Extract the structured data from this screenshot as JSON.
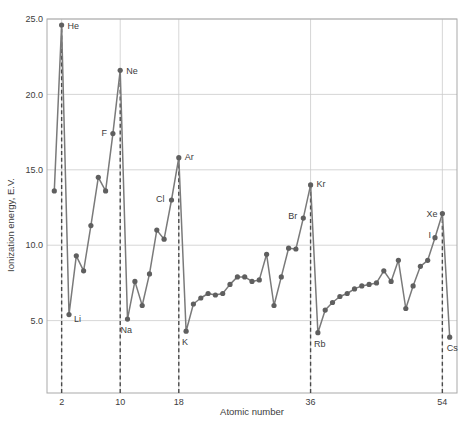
{
  "figure": {
    "background": "#ffffff"
  },
  "colors": {
    "line": "#7a7a7a",
    "marker": "#5f5f5f",
    "dashed_guide": "#4a4a4a",
    "grid": "#cccccc",
    "frame": "#a9a9a9",
    "text": "#3c3c3c"
  },
  "chart_data": {
    "type": "line",
    "title": "",
    "xlabel": "Atomic number",
    "ylabel": "Ionization energy, E.V.",
    "xlim": [
      0,
      56
    ],
    "ylim": [
      0.2,
      25.0
    ],
    "grid": true,
    "x_ticks": [
      {
        "value": 2,
        "label": "2"
      },
      {
        "value": 10,
        "label": "10"
      },
      {
        "value": 18,
        "label": "18"
      },
      {
        "value": 36,
        "label": "36"
      },
      {
        "value": 54,
        "label": "54"
      }
    ],
    "y_ticks": [
      {
        "value": 5,
        "label": "5.0"
      },
      {
        "value": 10,
        "label": "10.0"
      },
      {
        "value": 15,
        "label": "15.0"
      },
      {
        "value": 20,
        "label": "20.0"
      },
      {
        "value": 25,
        "label": "25.0"
      }
    ],
    "series": [
      {
        "name": "First ionization energy",
        "points": [
          {
            "Z": 1,
            "symbol": "H",
            "ev": 13.6
          },
          {
            "Z": 2,
            "symbol": "He",
            "ev": 24.6,
            "label": "He",
            "label_anchor": "start",
            "label_dx": 6,
            "label_dy": 4
          },
          {
            "Z": 3,
            "symbol": "Li",
            "ev": 5.4,
            "label": "Li",
            "label_anchor": "start",
            "label_dx": 5,
            "label_dy": 7
          },
          {
            "Z": 4,
            "symbol": "Be",
            "ev": 9.3
          },
          {
            "Z": 5,
            "symbol": "B",
            "ev": 8.3
          },
          {
            "Z": 6,
            "symbol": "C",
            "ev": 11.3
          },
          {
            "Z": 7,
            "symbol": "N",
            "ev": 14.5
          },
          {
            "Z": 8,
            "symbol": "O",
            "ev": 13.6
          },
          {
            "Z": 9,
            "symbol": "F",
            "ev": 17.4,
            "label": "F",
            "label_anchor": "end",
            "label_dx": -6,
            "label_dy": 2
          },
          {
            "Z": 10,
            "symbol": "Ne",
            "ev": 21.6,
            "label": "Ne",
            "label_anchor": "start",
            "label_dx": 6,
            "label_dy": 4
          },
          {
            "Z": 11,
            "symbol": "Na",
            "ev": 5.1,
            "label": "Na",
            "label_anchor": "start",
            "label_dx": -7,
            "label_dy": 14
          },
          {
            "Z": 12,
            "symbol": "Mg",
            "ev": 7.6
          },
          {
            "Z": 13,
            "symbol": "Al",
            "ev": 6.0
          },
          {
            "Z": 14,
            "symbol": "Si",
            "ev": 8.1
          },
          {
            "Z": 15,
            "symbol": "P",
            "ev": 11.0
          },
          {
            "Z": 16,
            "symbol": "S",
            "ev": 10.4
          },
          {
            "Z": 17,
            "symbol": "Cl",
            "ev": 13.0,
            "label": "Cl",
            "label_anchor": "end",
            "label_dx": -7,
            "label_dy": 2
          },
          {
            "Z": 18,
            "symbol": "Ar",
            "ev": 15.8,
            "label": "Ar",
            "label_anchor": "start",
            "label_dx": 6,
            "label_dy": 2
          },
          {
            "Z": 19,
            "symbol": "K",
            "ev": 4.3,
            "label": "K",
            "label_anchor": "start",
            "label_dx": -4,
            "label_dy": 14
          },
          {
            "Z": 20,
            "symbol": "Ca",
            "ev": 6.1
          },
          {
            "Z": 21,
            "symbol": "Sc",
            "ev": 6.5
          },
          {
            "Z": 22,
            "symbol": "Ti",
            "ev": 6.8
          },
          {
            "Z": 23,
            "symbol": "V",
            "ev": 6.7
          },
          {
            "Z": 24,
            "symbol": "Cr",
            "ev": 6.8
          },
          {
            "Z": 25,
            "symbol": "Mn",
            "ev": 7.4
          },
          {
            "Z": 26,
            "symbol": "Fe",
            "ev": 7.9
          },
          {
            "Z": 27,
            "symbol": "Co",
            "ev": 7.9
          },
          {
            "Z": 28,
            "symbol": "Ni",
            "ev": 7.6
          },
          {
            "Z": 29,
            "symbol": "Cu",
            "ev": 7.7
          },
          {
            "Z": 30,
            "symbol": "Zn",
            "ev": 9.4
          },
          {
            "Z": 31,
            "symbol": "Ga",
            "ev": 6.0
          },
          {
            "Z": 32,
            "symbol": "Ge",
            "ev": 7.9
          },
          {
            "Z": 33,
            "symbol": "As",
            "ev": 9.8
          },
          {
            "Z": 34,
            "symbol": "Se",
            "ev": 9.75
          },
          {
            "Z": 35,
            "symbol": "Br",
            "ev": 11.8,
            "label": "Br",
            "label_anchor": "end",
            "label_dx": -6,
            "label_dy": 1
          },
          {
            "Z": 36,
            "symbol": "Kr",
            "ev": 14.0,
            "label": "Kr",
            "label_anchor": "start",
            "label_dx": 6,
            "label_dy": 2
          },
          {
            "Z": 37,
            "symbol": "Rb",
            "ev": 4.2,
            "label": "Rb",
            "label_anchor": "start",
            "label_dx": -4,
            "label_dy": 14
          },
          {
            "Z": 38,
            "symbol": "Sr",
            "ev": 5.7
          },
          {
            "Z": 39,
            "symbol": "Y",
            "ev": 6.2
          },
          {
            "Z": 40,
            "symbol": "Zr",
            "ev": 6.6
          },
          {
            "Z": 41,
            "symbol": "Nb",
            "ev": 6.8
          },
          {
            "Z": 42,
            "symbol": "Mo",
            "ev": 7.1
          },
          {
            "Z": 43,
            "symbol": "Tc",
            "ev": 7.3
          },
          {
            "Z": 44,
            "symbol": "Ru",
            "ev": 7.4
          },
          {
            "Z": 45,
            "symbol": "Rh",
            "ev": 7.5
          },
          {
            "Z": 46,
            "symbol": "Pd",
            "ev": 8.3
          },
          {
            "Z": 47,
            "symbol": "Ag",
            "ev": 7.6
          },
          {
            "Z": 48,
            "symbol": "Cd",
            "ev": 9.0
          },
          {
            "Z": 49,
            "symbol": "In",
            "ev": 5.8
          },
          {
            "Z": 50,
            "symbol": "Sn",
            "ev": 7.3
          },
          {
            "Z": 51,
            "symbol": "Sb",
            "ev": 8.6
          },
          {
            "Z": 52,
            "symbol": "Te",
            "ev": 9.0
          },
          {
            "Z": 53,
            "symbol": "I",
            "ev": 10.5,
            "label": "I",
            "label_anchor": "end",
            "label_dx": -4,
            "label_dy": 0
          },
          {
            "Z": 54,
            "symbol": "Xe",
            "ev": 12.1,
            "label": "Xe",
            "label_anchor": "end",
            "label_dx": -5,
            "label_dy": 3
          },
          {
            "Z": 55,
            "symbol": "Cs",
            "ev": 3.9,
            "label": "Cs",
            "label_anchor": "start",
            "label_dx": -3,
            "label_dy": 14
          }
        ]
      }
    ],
    "dashed_guides": [
      {
        "Z": 2,
        "to_ev": 24.6
      },
      {
        "Z": 10,
        "to_ev": 21.6
      },
      {
        "Z": 18,
        "to_ev": 15.8
      },
      {
        "Z": 36,
        "to_ev": 14.0
      },
      {
        "Z": 54,
        "to_ev": 12.1
      }
    ]
  }
}
